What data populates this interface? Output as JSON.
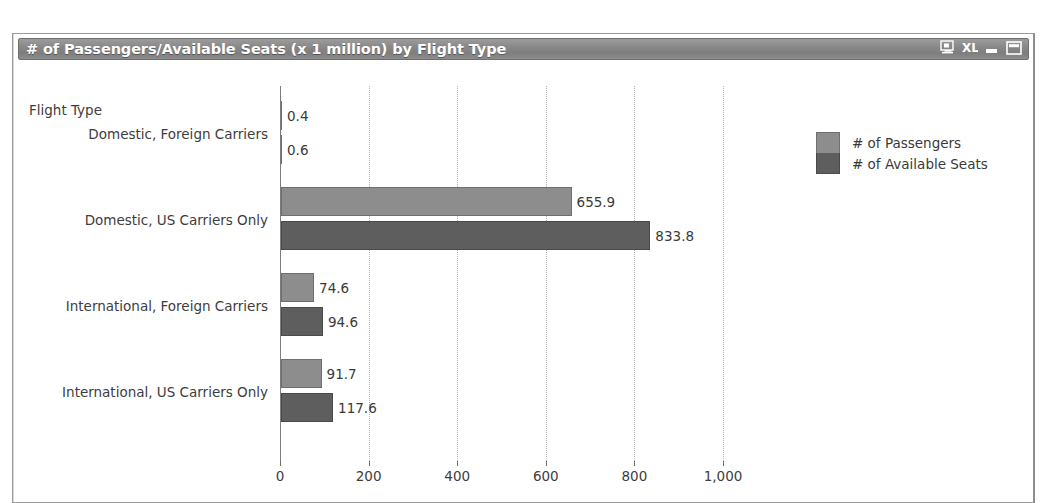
{
  "window": {
    "title": "# of Passengers/Available Seats (x 1 million) by Flight Type",
    "controls": [
      {
        "name": "display-icon",
        "label": "Display"
      },
      {
        "name": "excel-export-icon",
        "label": "XL"
      },
      {
        "name": "minimize-button",
        "label": "Minimize"
      },
      {
        "name": "maximize-button",
        "label": "Maximize"
      }
    ]
  },
  "chart_data": {
    "type": "bar",
    "orientation": "horizontal",
    "title": "# of Passengers/Available Seats (x 1 million) by Flight Type",
    "xlabel": "",
    "ylabel": "Flight Type",
    "categories": [
      "Domestic, Foreign Carriers",
      "Domestic, US Carriers Only",
      "International, Foreign Carriers",
      "International, US Carriers Only"
    ],
    "series": [
      {
        "name": "# of Passengers",
        "color": "#8d8d8d",
        "values": [
          0.4,
          655.9,
          74.6,
          91.7
        ],
        "labels": [
          "0.4",
          "655.9",
          "74.6",
          "91.7"
        ]
      },
      {
        "name": "# of Available Seats",
        "color": "#5e5e5e",
        "values": [
          0.6,
          833.8,
          94.6,
          117.6
        ],
        "labels": [
          "0.6",
          "833.8",
          "94.6",
          "117.6"
        ]
      }
    ],
    "xlim": [
      0,
      1000
    ],
    "xticks": [
      0,
      200,
      400,
      600,
      800,
      1000
    ],
    "xtick_labels": [
      "0",
      "200",
      "400",
      "600",
      "800",
      "1,000"
    ],
    "grid": true,
    "legend_position": "right"
  },
  "axis": {
    "y_title": "Flight Type"
  }
}
